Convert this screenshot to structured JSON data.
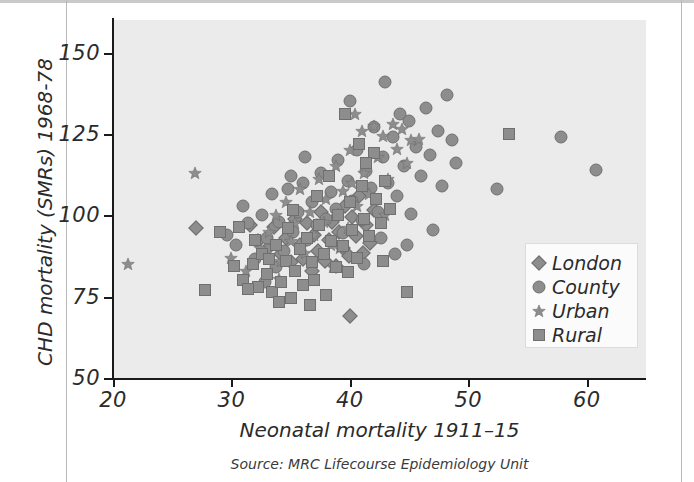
{
  "chart_data": {
    "type": "scatter",
    "title": "",
    "xlabel": "Neonatal mortality 1911–15",
    "ylabel": "CHD mortality (SMRs) 1968-78",
    "source": "Source: MRC Lifecourse Epidemiology Unit",
    "xlim": [
      20,
      65
    ],
    "ylim": [
      50,
      160
    ],
    "xticks": [
      20,
      30,
      40,
      50,
      60
    ],
    "yticks": [
      50,
      75,
      100,
      125,
      150
    ],
    "grid": false,
    "legend_position": "lower-right",
    "marker_color": "#8d8d8d",
    "marker_edge_color": "#6f6f6f",
    "panel_color": "#ebebeb",
    "series": [
      {
        "name": "London",
        "marker": "diamond",
        "points": [
          [
            27.0,
            96.0
          ],
          [
            31.6,
            97.0
          ],
          [
            32.2,
            92.0
          ],
          [
            33.0,
            89.5
          ],
          [
            33.6,
            96.5
          ],
          [
            34.2,
            88.0
          ],
          [
            34.6,
            93.0
          ],
          [
            35.0,
            85.5
          ],
          [
            35.4,
            99.0
          ],
          [
            35.8,
            91.0
          ],
          [
            36.0,
            86.5
          ],
          [
            36.4,
            97.5
          ],
          [
            36.8,
            83.0
          ],
          [
            37.0,
            94.0
          ],
          [
            37.3,
            89.0
          ],
          [
            37.6,
            101.0
          ],
          [
            37.9,
            86.0
          ],
          [
            38.2,
            92.5
          ],
          [
            38.5,
            98.0
          ],
          [
            38.8,
            84.5
          ],
          [
            39.1,
            95.0
          ],
          [
            39.4,
            90.0
          ],
          [
            39.6,
            103.0
          ],
          [
            39.9,
            87.5
          ],
          [
            40.2,
            99.5
          ],
          [
            40.5,
            93.5
          ],
          [
            40.8,
            106.0
          ],
          [
            41.1,
            88.5
          ],
          [
            41.4,
            97.0
          ],
          [
            41.7,
            91.5
          ],
          [
            42.0,
            101.5
          ],
          [
            40.0,
            69.0
          ]
        ]
      },
      {
        "name": "County",
        "marker": "circle",
        "points": [
          [
            29.6,
            94.0
          ],
          [
            30.4,
            91.0
          ],
          [
            31.0,
            103.0
          ],
          [
            31.4,
            97.5
          ],
          [
            32.0,
            86.5
          ],
          [
            32.6,
            100.0
          ],
          [
            33.0,
            93.0
          ],
          [
            33.4,
            106.5
          ],
          [
            34.0,
            98.0
          ],
          [
            34.4,
            89.0
          ],
          [
            34.8,
            108.0
          ],
          [
            35.2,
            95.0
          ],
          [
            35.6,
            101.0
          ],
          [
            36.0,
            110.0
          ],
          [
            36.4,
            92.5
          ],
          [
            36.8,
            104.0
          ],
          [
            37.2,
            97.0
          ],
          [
            37.6,
            113.0
          ],
          [
            38.0,
            99.0
          ],
          [
            38.4,
            107.0
          ],
          [
            38.8,
            102.0
          ],
          [
            39.0,
            117.0
          ],
          [
            39.4,
            94.5
          ],
          [
            39.8,
            110.5
          ],
          [
            40.0,
            135.0
          ],
          [
            40.2,
            104.5
          ],
          [
            40.6,
            120.0
          ],
          [
            41.0,
            98.5
          ],
          [
            41.4,
            113.5
          ],
          [
            41.8,
            108.5
          ],
          [
            42.0,
            127.0
          ],
          [
            42.4,
            101.0
          ],
          [
            42.8,
            118.0
          ],
          [
            43.0,
            141.0
          ],
          [
            43.2,
            110.0
          ],
          [
            43.6,
            124.0
          ],
          [
            44.0,
            106.0
          ],
          [
            44.2,
            131.0
          ],
          [
            44.6,
            115.0
          ],
          [
            45.0,
            129.0
          ],
          [
            45.2,
            100.5
          ],
          [
            45.6,
            121.0
          ],
          [
            46.0,
            112.0
          ],
          [
            46.4,
            133.0
          ],
          [
            46.8,
            118.5
          ],
          [
            47.0,
            95.5
          ],
          [
            47.4,
            126.0
          ],
          [
            47.8,
            109.0
          ],
          [
            48.2,
            137.0
          ],
          [
            48.6,
            123.0
          ],
          [
            49.0,
            116.0
          ],
          [
            52.4,
            108.0
          ],
          [
            57.8,
            124.0
          ],
          [
            60.8,
            114.0
          ],
          [
            43.8,
            88.0
          ],
          [
            44.8,
            91.0
          ],
          [
            36.2,
            118.0
          ],
          [
            35.0,
            112.0
          ],
          [
            33.8,
            84.0
          ],
          [
            32.8,
            79.5
          ],
          [
            41.2,
            85.0
          ],
          [
            42.6,
            93.0
          ]
        ]
      },
      {
        "name": "Urban",
        "marker": "star",
        "points": [
          [
            21.3,
            85.0
          ],
          [
            26.9,
            113.0
          ],
          [
            30.0,
            87.0
          ],
          [
            31.2,
            83.0
          ],
          [
            32.4,
            90.0
          ],
          [
            33.2,
            95.0
          ],
          [
            33.8,
            100.0
          ],
          [
            34.2,
            86.0
          ],
          [
            34.6,
            104.0
          ],
          [
            35.0,
            92.0
          ],
          [
            35.4,
            97.5
          ],
          [
            35.8,
            108.0
          ],
          [
            36.2,
            88.5
          ],
          [
            36.6,
            101.0
          ],
          [
            37.0,
            94.0
          ],
          [
            37.4,
            111.0
          ],
          [
            37.8,
            98.0
          ],
          [
            38.0,
            105.0
          ],
          [
            38.4,
            91.0
          ],
          [
            38.8,
            115.0
          ],
          [
            39.0,
            100.5
          ],
          [
            39.4,
            107.5
          ],
          [
            39.8,
            96.0
          ],
          [
            40.0,
            120.0
          ],
          [
            40.2,
            110.0
          ],
          [
            40.6,
            103.0
          ],
          [
            41.0,
            126.0
          ],
          [
            41.2,
            113.0
          ],
          [
            41.6,
            106.5
          ],
          [
            42.0,
            127.5
          ],
          [
            42.4,
            118.0
          ],
          [
            42.8,
            124.5
          ],
          [
            43.2,
            111.0
          ],
          [
            43.6,
            128.0
          ],
          [
            44.0,
            120.5
          ],
          [
            44.4,
            126.5
          ],
          [
            44.8,
            116.0
          ],
          [
            45.2,
            123.0
          ],
          [
            40.4,
            131.0
          ],
          [
            45.8,
            123.5
          ],
          [
            38.6,
            84.0
          ],
          [
            34.0,
            80.5
          ],
          [
            39.2,
            90.0
          ],
          [
            43.0,
            100.0
          ]
        ]
      },
      {
        "name": "Rural",
        "marker": "square",
        "points": [
          [
            27.8,
            77.0
          ],
          [
            29.0,
            95.0
          ],
          [
            30.6,
            96.5
          ],
          [
            31.0,
            80.0
          ],
          [
            31.8,
            85.0
          ],
          [
            32.2,
            78.0
          ],
          [
            32.6,
            88.0
          ],
          [
            33.0,
            82.0
          ],
          [
            33.4,
            76.5
          ],
          [
            33.8,
            91.0
          ],
          [
            34.2,
            79.5
          ],
          [
            34.6,
            86.0
          ],
          [
            35.0,
            74.5
          ],
          [
            35.4,
            83.0
          ],
          [
            35.8,
            89.5
          ],
          [
            36.0,
            78.5
          ],
          [
            36.4,
            93.0
          ],
          [
            36.8,
            85.5
          ],
          [
            37.0,
            80.0
          ],
          [
            37.4,
            97.0
          ],
          [
            37.8,
            88.0
          ],
          [
            38.0,
            75.5
          ],
          [
            38.4,
            92.0
          ],
          [
            38.8,
            84.0
          ],
          [
            39.0,
            100.0
          ],
          [
            39.4,
            90.5
          ],
          [
            39.8,
            82.5
          ],
          [
            40.0,
            104.0
          ],
          [
            40.2,
            95.5
          ],
          [
            40.6,
            87.0
          ],
          [
            41.0,
            109.0
          ],
          [
            41.2,
            99.0
          ],
          [
            41.6,
            93.5
          ],
          [
            42.0,
            119.0
          ],
          [
            42.2,
            105.0
          ],
          [
            42.6,
            97.5
          ],
          [
            39.6,
            131.0
          ],
          [
            40.8,
            122.0
          ],
          [
            41.4,
            116.0
          ],
          [
            43.0,
            110.5
          ],
          [
            43.4,
            102.0
          ],
          [
            31.4,
            77.5
          ],
          [
            34.0,
            73.5
          ],
          [
            36.6,
            72.5
          ],
          [
            44.8,
            76.5
          ],
          [
            53.4,
            125.0
          ],
          [
            35.2,
            101.5
          ],
          [
            38.2,
            112.0
          ],
          [
            37.2,
            106.0
          ],
          [
            34.8,
            96.0
          ],
          [
            33.2,
            86.5
          ],
          [
            30.2,
            84.5
          ],
          [
            32.0,
            92.5
          ],
          [
            42.8,
            86.0
          ]
        ]
      }
    ]
  },
  "legend": {
    "items": [
      {
        "label": "London",
        "marker": "diamond"
      },
      {
        "label": "County",
        "marker": "circle"
      },
      {
        "label": "Urban",
        "marker": "star"
      },
      {
        "label": "Rural",
        "marker": "square"
      }
    ]
  },
  "axes": {
    "y_title": "CHD mortality (SMRs) 1968-78",
    "x_title": "Neonatal mortality 1911–15",
    "y_ticklabels": [
      "150",
      "125",
      "100",
      "75",
      "50"
    ],
    "x_ticklabels": [
      "20",
      "30",
      "40",
      "50",
      "60"
    ]
  },
  "footer": {
    "source": "Source: MRC Lifecourse Epidemiology Unit"
  }
}
